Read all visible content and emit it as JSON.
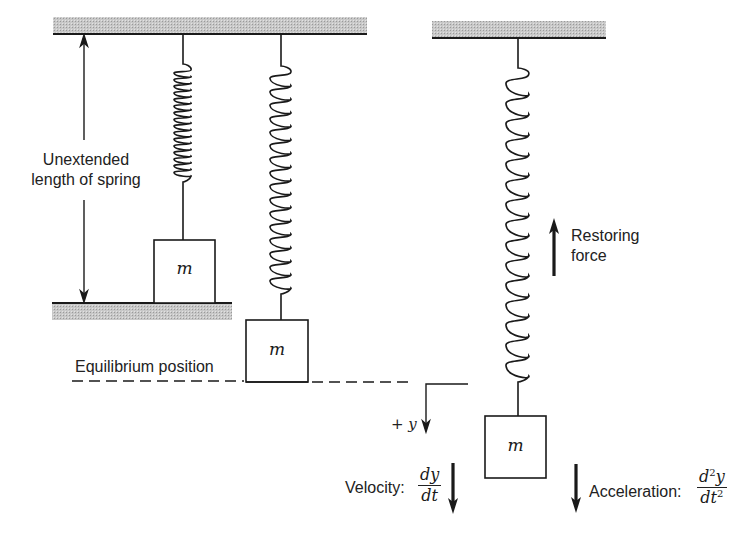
{
  "labels": {
    "unextended_line1": "Unextended",
    "unextended_line2": "length of spring",
    "equilibrium": "Equilibrium position",
    "restoring_line1": "Restoring",
    "restoring_line2": "force",
    "plus_y": "+ y",
    "velocity": "Velocity:",
    "velocity_num": "dy",
    "velocity_den": "dt",
    "acceleration": "Acceleration:",
    "accel_num_d": "d",
    "accel_num_exp": "2",
    "accel_num_y": "y",
    "accel_den_dt": "dt",
    "accel_den_exp": "2"
  },
  "masses": [
    {
      "label": "m",
      "state": "unextended"
    },
    {
      "label": "m",
      "state": "equilibrium"
    },
    {
      "label": "m",
      "state": "displaced"
    }
  ],
  "colors": {
    "ink": "#1a1a1a",
    "hatch": "#bdbdbd"
  }
}
